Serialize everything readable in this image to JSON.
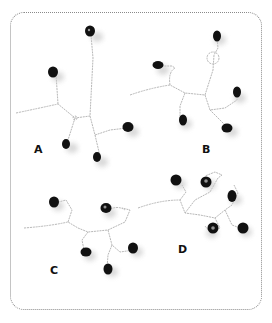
{
  "figure": {
    "frame_style": "dotted rounded rectangle",
    "colors": {
      "bead": "#111111",
      "wire": "#b8b8b8",
      "shadow": "#cfcfcf",
      "frame": "#8a8a8a"
    },
    "panels": [
      {
        "id": "A",
        "label": "A"
      },
      {
        "id": "B",
        "label": "B"
      },
      {
        "id": "C",
        "label": "C"
      },
      {
        "id": "D",
        "label": "D"
      }
    ]
  }
}
